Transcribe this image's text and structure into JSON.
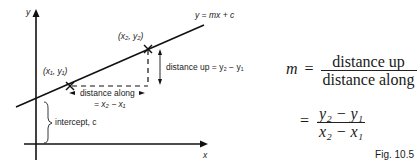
{
  "diagram": {
    "axes": {
      "x_label": "x",
      "y_label": "y"
    },
    "line_label": "y = mx + c",
    "point1": "(x₁, y₁)",
    "point2": "(x₂, y₂)",
    "distance_up": "distance up = y₂ − y₁",
    "distance_along_line1": "distance along",
    "distance_along_line2": "= x₂ − x₁",
    "intercept": "intercept, c"
  },
  "formula": {
    "m": "m",
    "equals": "=",
    "num1": "distance up",
    "den1": "distance along",
    "num2": "y₂ − y₁",
    "den2": "x₂ − x₁"
  },
  "caption": "Fig. 10.5"
}
